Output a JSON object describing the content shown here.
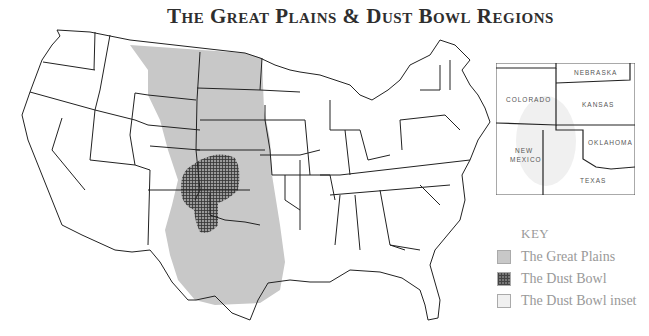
{
  "title": "The Great Plains & Dust Bowl Regions",
  "inset": {
    "states": [
      {
        "name": "NEBRASKA"
      },
      {
        "name": "COLORADO"
      },
      {
        "name": "KANSAS"
      },
      {
        "name": "OKLAHOMA"
      },
      {
        "name": "NEW"
      },
      {
        "name": "MEXICO"
      },
      {
        "name": "TEXAS"
      }
    ]
  },
  "key": {
    "title": "KEY",
    "items": [
      {
        "label": "The Great Plains",
        "color": "#c8c8c8"
      },
      {
        "label": "The Dust Bowl",
        "color": "#555555"
      },
      {
        "label": "The Dust Bowl inset",
        "color": "#f0f0f0"
      }
    ]
  },
  "colors": {
    "plains": "#c8c8c8",
    "dust_bowl": "#555555",
    "state_lines": "#222222",
    "title": "#2e2e2e",
    "key_text": "#999999"
  }
}
